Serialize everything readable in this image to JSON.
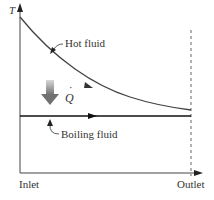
{
  "diagram": {
    "y_axis": {
      "label": "T"
    },
    "x_axis": {
      "start_label": "Inlet",
      "end_label": "Outlet"
    },
    "curves": [
      {
        "name": "hot-fluid",
        "label": "Hot fluid",
        "shape": "exponential-decay",
        "color": "#444444"
      },
      {
        "name": "boiling-fluid",
        "label": "Boiling fluid",
        "shape": "constant",
        "color": "#111111"
      }
    ],
    "heat_transfer": {
      "symbol": "Q",
      "dot": "˙",
      "arrow_color": "#888888"
    },
    "outlet_marker": {
      "style": "dashed"
    }
  }
}
